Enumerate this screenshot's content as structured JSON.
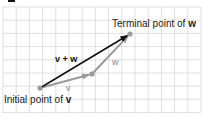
{
  "figure": {
    "grid": {
      "x0": 3,
      "y0": 7,
      "cols": 15,
      "rows": 8,
      "cell": 13.2
    },
    "points": {
      "initial_v": {
        "x": 40,
        "y": 88,
        "label_prefix": "Initial point of ",
        "label_vec": "v"
      },
      "terminal_v": {
        "x": 92,
        "y": 74
      },
      "terminal_w": {
        "x": 130,
        "y": 34,
        "label_prefix": "Terminal point of ",
        "label_vec": "w"
      }
    },
    "vectors": [
      {
        "name": "v",
        "label": "v",
        "color": "#9a9a9a"
      },
      {
        "name": "w",
        "label": "w",
        "color": "#9a9a9a"
      },
      {
        "name": "v+w",
        "label": "v + w",
        "color": "#111111"
      }
    ],
    "colors": {
      "grid": "#d8d8d8",
      "point": "#9a9a9a",
      "resultant": "#111111",
      "component": "#9a9a9a"
    }
  }
}
